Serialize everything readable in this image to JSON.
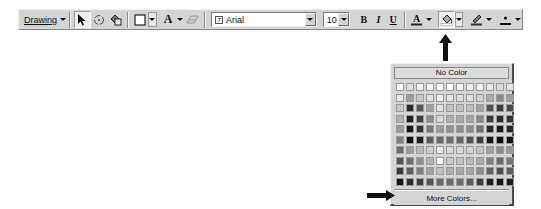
{
  "toolbar": {
    "drawing_menu": {
      "label": "Drawing",
      "icon": "caret-down-icon"
    },
    "tools": [
      {
        "name": "select-objects",
        "icon": "pointer-arrow-icon"
      },
      {
        "name": "free-rotate",
        "icon": "rotate-icon"
      },
      {
        "name": "autoshapes",
        "icon": "shapes-icon"
      },
      {
        "name": "shape-style",
        "icon": "rectangle-icon"
      },
      {
        "name": "font-color-text",
        "icon": "letter-a-icon"
      },
      {
        "name": "text-box",
        "icon": "textbox-icon"
      }
    ],
    "font": {
      "value": "Arial",
      "icon": "truetype-icon"
    },
    "font_size": {
      "value": "10"
    },
    "format_buttons": {
      "bold": "B",
      "italic": "I",
      "underline": "U"
    },
    "color_buttons": [
      {
        "name": "font-color",
        "icon": "font-color-icon",
        "glyph": "A"
      },
      {
        "name": "fill-color",
        "icon": "paint-bucket-icon",
        "pressed": true
      },
      {
        "name": "line-color",
        "icon": "pen-icon"
      },
      {
        "name": "line-style",
        "icon": "line-weight-icon"
      }
    ]
  },
  "fill_color_popup": {
    "no_color_label": "No Color",
    "more_colors_label": "More Colors...",
    "rows": 10,
    "columns": 12,
    "swatches": [
      [
        "#ffffff",
        "#e0e0e0",
        "#f0f0f0",
        "#f4f4f4",
        "#f8f8f8",
        "#ffffff",
        "#f4f4f4",
        "#eeeeee",
        "#f0f0f0",
        "#e8e8e8",
        "#dcdcdc",
        "#e4e4e4"
      ],
      [
        "#e8e8e8",
        "#9a9a9a",
        "#c8c8c8",
        "#dedede",
        "#f0f0f0",
        "#e4e4e4",
        "#dddddd",
        "#e0e0e0",
        "#d0d0d0",
        "#a8a8a8",
        "#8a8a8a",
        "#9c9c9c"
      ],
      [
        "#c8c8c8",
        "#2a2a2a",
        "#585858",
        "#a0a0a0",
        "#e0e0e0",
        "#c4c4c4",
        "#c0c0c0",
        "#bcbcbc",
        "#a0a0a0",
        "#505050",
        "#3c3c3c",
        "#4a4a4a"
      ],
      [
        "#b0b0b0",
        "#1e1e1e",
        "#3e3e3e",
        "#8a8a8a",
        "#d8d8d8",
        "#b0b0b0",
        "#a8a8a8",
        "#a4a4a4",
        "#888888",
        "#3a3a3a",
        "#2a2a2a",
        "#333333"
      ],
      [
        "#9a9a9a",
        "#141414",
        "#303030",
        "#787878",
        "#9a9a9a",
        "#909090",
        "#8c8c8c",
        "#8a8a8a",
        "#707070",
        "#262626",
        "#1a1a1a",
        "#242424"
      ],
      [
        "#808080",
        "#0c0c0c",
        "#222222",
        "#5a5a5a",
        "#6a6a6a",
        "#6c6c6c",
        "#686868",
        "#505050",
        "#3e3e3e",
        "#161616",
        "#0e0e0e",
        "#141414"
      ],
      [
        "#6a6a6a",
        "#9a9a9a",
        "#b8b8b8",
        "#d0d0d0",
        "#e8e8e8",
        "#dcdcdc",
        "#d8d8d8",
        "#d4d4d4",
        "#c4c4c4",
        "#a0a0a0",
        "#8c8c8c",
        "#969696"
      ],
      [
        "#545454",
        "#6e6e6e",
        "#8e8e8e",
        "#b4b4b4",
        "#f4f4f4",
        "#c8c8c8",
        "#c0c0c0",
        "#b8b8b8",
        "#a8a8a8",
        "#7e7e7e",
        "#6a6a6a",
        "#747474"
      ],
      [
        "#3a3a3a",
        "#5c5c5c",
        "#7c7c7c",
        "#a0a0a0",
        "#c0c0c0",
        "#b0b0b0",
        "#a8a8a8",
        "#a4a4a4",
        "#8e8e8e",
        "#606060",
        "#505050",
        "#5a5a5a"
      ],
      [
        "#141414",
        "#2a2a2a",
        "#3e3e3e",
        "#565656",
        "#6a6a6a",
        "#6e6e6e",
        "#6a6a6a",
        "#5c5c5c",
        "#3e3e3e",
        "#1e1e1e",
        "#141414",
        "#1a1a1a"
      ]
    ]
  },
  "annotations": {
    "up_arrow_target": "fill-color-dropdown",
    "right_arrow_target": "more-colors-button"
  }
}
